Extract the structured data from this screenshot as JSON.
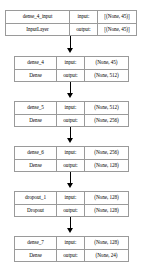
{
  "diagram": {
    "nodes": [
      {
        "id": "dense_4_input",
        "name": "dense_4_input",
        "type": "InputLayer",
        "input_label": "input:",
        "output_label": "output:",
        "input_shape": "[(None, 45)]",
        "output_shape": "[(None, 45)]",
        "top": 10,
        "style": "input-node"
      },
      {
        "id": "dense_4",
        "name": "dense_4",
        "type": "Dense",
        "input_label": "input:",
        "output_label": "output:",
        "input_shape": "(None, 45)",
        "output_shape": "(None, 512)",
        "top": 56,
        "style": "layer-node"
      },
      {
        "id": "dense_5",
        "name": "dense_5",
        "type": "Dense",
        "input_label": "input:",
        "output_label": "output:",
        "input_shape": "(None, 512)",
        "output_shape": "(None, 256)",
        "top": 101,
        "style": "layer-node"
      },
      {
        "id": "dense_6",
        "name": "dense_6",
        "type": "Dense",
        "input_label": "input:",
        "output_label": "output:",
        "input_shape": "(None, 256)",
        "output_shape": "(None, 128)",
        "top": 146,
        "style": "layer-node"
      },
      {
        "id": "dropout_1",
        "name": "dropout_1",
        "type": "Dropout",
        "input_label": "input:",
        "output_label": "output:",
        "input_shape": "(None, 128)",
        "output_shape": "(None, 128)",
        "top": 191,
        "style": "layer-node"
      },
      {
        "id": "dense_7",
        "name": "dense_7",
        "type": "Dense",
        "input_label": "input:",
        "output_label": "output:",
        "input_shape": "(None, 128)",
        "output_shape": "(None, 24)",
        "top": 236,
        "style": "layer-node"
      }
    ],
    "edges": [
      {
        "from": "dense_4_input",
        "to": "dense_4",
        "top": 36,
        "height": 14
      },
      {
        "from": "dense_4",
        "to": "dense_5",
        "top": 82,
        "height": 13
      },
      {
        "from": "dense_5",
        "to": "dense_6",
        "top": 127,
        "height": 13
      },
      {
        "from": "dense_6",
        "to": "dropout_1",
        "top": 172,
        "height": 13
      },
      {
        "from": "dropout_1",
        "to": "dense_7",
        "top": 217,
        "height": 13
      }
    ],
    "colors": {
      "border": "#9a9a9a",
      "background": "#ffffff",
      "text": "#000000",
      "arrow": "#000000"
    }
  }
}
